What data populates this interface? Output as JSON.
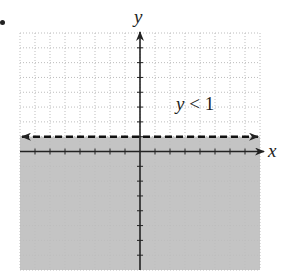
{
  "chart_data": {
    "type": "inequality-graph",
    "title": "",
    "inequality": "y < 1",
    "boundary": {
      "equation": "y = 1",
      "style": "dashed",
      "arrows": "both"
    },
    "shaded_region": "below boundary line (y < 1)",
    "xlabel": "x",
    "ylabel": "y",
    "xlim": [
      -8,
      8
    ],
    "ylim": [
      -8,
      8
    ],
    "grid": true,
    "grid_step": 1,
    "colors": {
      "shade": "#c4c4c4",
      "grid": "#bdbdbd",
      "axis": "#222222",
      "boundary": "#111111"
    }
  },
  "labels": {
    "x_axis": "x",
    "y_axis": "y",
    "inequality_var": "y",
    "inequality_rest": " < 1"
  }
}
